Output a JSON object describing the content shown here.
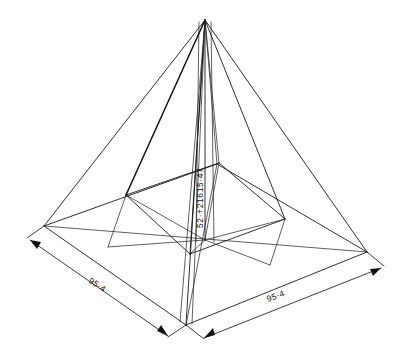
{
  "drawing": {
    "title": "Isometric pyramid engineering sketch",
    "subject": "square-base-pyramid",
    "background_color": "#ffffff",
    "line_color": "#1a1a1a",
    "dimensions": {
      "base_front_right": {
        "label": "95·4",
        "name": "base-edge-dimension-right",
        "orientation": "diagonal-up-right"
      },
      "base_front_left": {
        "label": "95·4",
        "name": "base-edge-dimension-left",
        "orientation": "diagonal-down-right"
      },
      "height": {
        "label": "52·+21615·47",
        "name": "apex-height-dimension",
        "orientation": "vertical-bottom-to-top"
      }
    },
    "geometry": {
      "apex": [
        205,
        20
      ],
      "base_corners": {
        "left": [
          44,
          226
        ],
        "back": [
          217,
          164
        ],
        "right": [
          367,
          252
        ],
        "front": [
          186,
          325
        ]
      },
      "inner_quad": {
        "left": [
          126,
          195
        ],
        "back": [
          219,
          163
        ],
        "right": [
          285,
          219
        ],
        "front": [
          190,
          254
        ]
      },
      "center": [
        205,
        240
      ]
    },
    "units": "feet-inches"
  }
}
